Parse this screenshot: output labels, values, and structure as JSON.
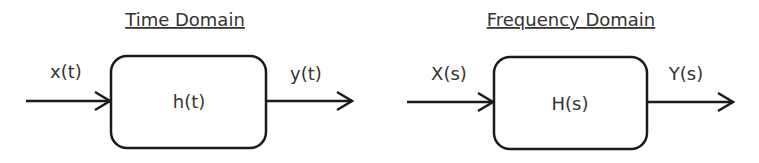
{
  "diagrams": [
    {
      "title": "Time Domain",
      "input_label": "x(t)",
      "system_label": "h(t)",
      "output_label": "y(t)"
    },
    {
      "title": "Frequency Domain",
      "input_label": "X(s)",
      "system_label": "H(s)",
      "output_label": "Y(s)"
    }
  ],
  "colors": {
    "stroke": "#1a1a1a",
    "text": "#333333",
    "background": "#ffffff"
  }
}
